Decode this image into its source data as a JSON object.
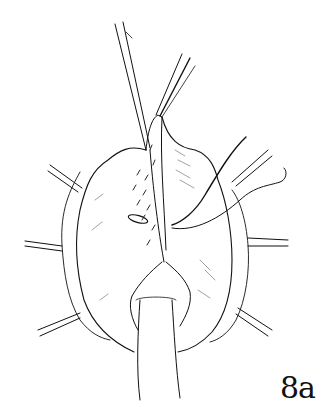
{
  "figure": {
    "label": "8a",
    "colors": {
      "ink": "#111111",
      "background": "#ffffff"
    }
  }
}
